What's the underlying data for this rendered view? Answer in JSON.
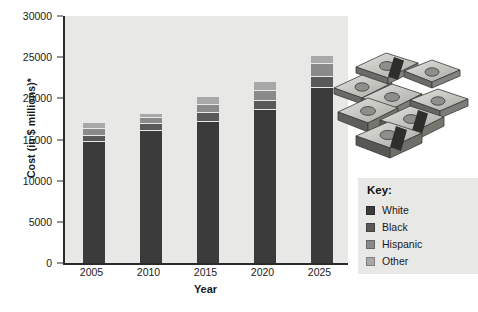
{
  "chart_data": {
    "type": "bar",
    "subtype": "stacked-bar",
    "title": "",
    "xlabel": "Year",
    "ylabel": "Cost (in $ millions)*",
    "categories": [
      "2005",
      "2010",
      "2015",
      "2020",
      "2025"
    ],
    "ylim": [
      0,
      30000
    ],
    "yticks": [
      0,
      5000,
      10000,
      15000,
      20000,
      25000,
      30000
    ],
    "ytick_labels": [
      "0",
      "5000",
      "10000",
      "15000",
      "20000",
      "25000",
      "30000"
    ],
    "grid": false,
    "legend_position": "right",
    "legend_title": "Key:",
    "series": [
      {
        "name": "White",
        "color": "#3b3b3b",
        "values": [
          14800,
          16100,
          17300,
          18700,
          21400
        ]
      },
      {
        "name": "Black",
        "color": "#595959",
        "values": [
          800,
          850,
          1000,
          1150,
          1300
        ]
      },
      {
        "name": "Hispanic",
        "color": "#8a8a8a",
        "values": [
          750,
          750,
          1000,
          1150,
          1600
        ]
      },
      {
        "name": "Other",
        "color": "#a8a8a8",
        "values": [
          650,
          400,
          900,
          1000,
          900
        ]
      }
    ],
    "totals": [
      17000,
      18100,
      20200,
      22000,
      25200
    ]
  },
  "axes": {
    "y_label": "Cost (in $ millions)*",
    "x_label": "Year"
  },
  "legend": {
    "title": "Key:",
    "items": [
      {
        "label": "White",
        "color": "#3b3b3b"
      },
      {
        "label": "Black",
        "color": "#595959"
      },
      {
        "label": "Hispanic",
        "color": "#8a8a8a"
      },
      {
        "label": "Other",
        "color": "#a8a8a8"
      }
    ]
  },
  "decoration": {
    "image_name": "stacked-cash-bundles-photo"
  }
}
